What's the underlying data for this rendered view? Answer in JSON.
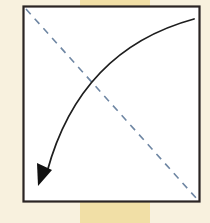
{
  "diagram": {
    "type": "origami-fold-step",
    "colors": {
      "page_background": "#f8f1de",
      "background_band": "#f1dfa6",
      "paper_fill": "#ffffff",
      "paper_border": "#2a2423",
      "fold_line": "#6e86a3",
      "arrow": "#1e1e1e"
    },
    "square": {
      "x": 23,
      "y": 6,
      "width": 177,
      "height": 196
    },
    "fold_line": {
      "style": "dashed",
      "from": [
        26,
        9
      ],
      "to": [
        197,
        199
      ]
    },
    "arrow": {
      "style": "solid-curved",
      "from": [
        194,
        19
      ],
      "control": [
        80,
        50
      ],
      "to": [
        42,
        182
      ],
      "head": "filled-triangle"
    }
  }
}
